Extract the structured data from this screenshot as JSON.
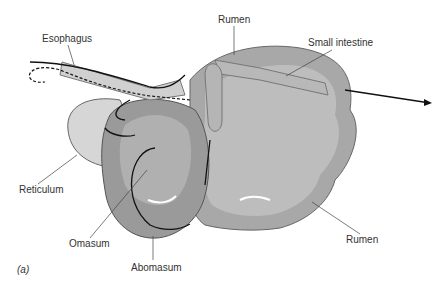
{
  "diagram": {
    "figure_label": "(a)",
    "labels": {
      "esophagus": "Esophagus",
      "rumen_top": "Rumen",
      "small_intestine": "Small intestine",
      "reticulum": "Reticulum",
      "omasum": "Omasum",
      "abomasum": "Abomasum",
      "rumen_bottom": "Rumen"
    },
    "colors": {
      "organ_light": "#d6d6d6",
      "organ_mid": "#a8a8a8",
      "organ_dark": "#8a8a8a",
      "outline": "#555555",
      "arrow": "#111111",
      "text": "#333333"
    }
  }
}
